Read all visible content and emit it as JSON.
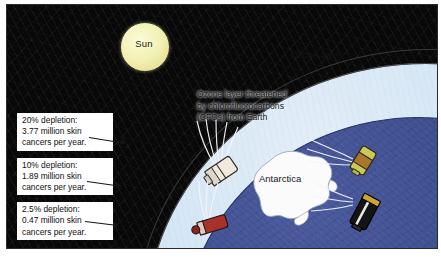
{
  "figure": {
    "title_alt": "Ozone layer depletion diagram",
    "background": "#ffffff"
  },
  "scene": {
    "sky_color": "#080808",
    "ozone_color": "#f4f2ee",
    "atmosphere_color": "#c9dff1",
    "globe_color": "#3d4d8e",
    "sun_color": "#f2f0b0"
  },
  "sun": {
    "label": "Sun"
  },
  "ozone": {
    "label": "Ozone layer"
  },
  "earth": {
    "antarctica_label": "Antarctica"
  },
  "caption": {
    "line1": "Ozone layer threatened",
    "line2": "by chlorofluorocarbons",
    "line3": "(CFCs) from Earth"
  },
  "callouts": [
    {
      "line1": "20% depletion:",
      "line2": "3.77 million skin",
      "line3": "cancers per year.",
      "depletion_percent": 20,
      "cancers_millions": 3.77
    },
    {
      "line1": "10% depletion:",
      "line2": "1.89 million skin",
      "line3": "cancers per year.",
      "depletion_percent": 10,
      "cancers_millions": 1.89
    },
    {
      "line1": "2.5% depletion:",
      "line2": "0.47 million skin",
      "line3": "cancers per year.",
      "depletion_percent": 2.5,
      "cancers_millions": 0.47
    }
  ],
  "spray_cans": [
    {
      "name": "white-aerosol-can",
      "color": "#efeadd"
    },
    {
      "name": "red-aerosol-can",
      "color": "#a8322a"
    },
    {
      "name": "yellow-aerosol-can",
      "color": "#c9c martin"
    },
    {
      "name": "black-aerosol-can",
      "color": "#141414"
    }
  ]
}
